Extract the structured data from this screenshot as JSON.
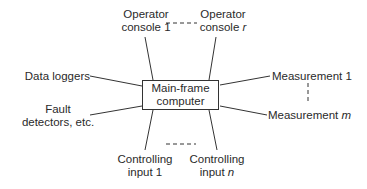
{
  "diagram": {
    "center": {
      "line1": "Main-frame",
      "line2": "computer"
    },
    "operator_console_1": {
      "line1": "Operator",
      "line2": "console 1"
    },
    "operator_console_r": {
      "line1": "Operator",
      "line2_prefix": "console ",
      "line2_var": "r"
    },
    "data_loggers": "Data loggers",
    "fault_detectors": {
      "line1": "Fault",
      "line2": "detectors, etc."
    },
    "measurement_1": "Measurement 1",
    "measurement_m": {
      "prefix": "Measurement ",
      "var": "m"
    },
    "controlling_input_1": {
      "line1": "Controlling",
      "line2": "input 1"
    },
    "controlling_input_n": {
      "line1": "Controlling",
      "line2_prefix": "input ",
      "line2_var": "n"
    },
    "line_color": "#333333"
  }
}
